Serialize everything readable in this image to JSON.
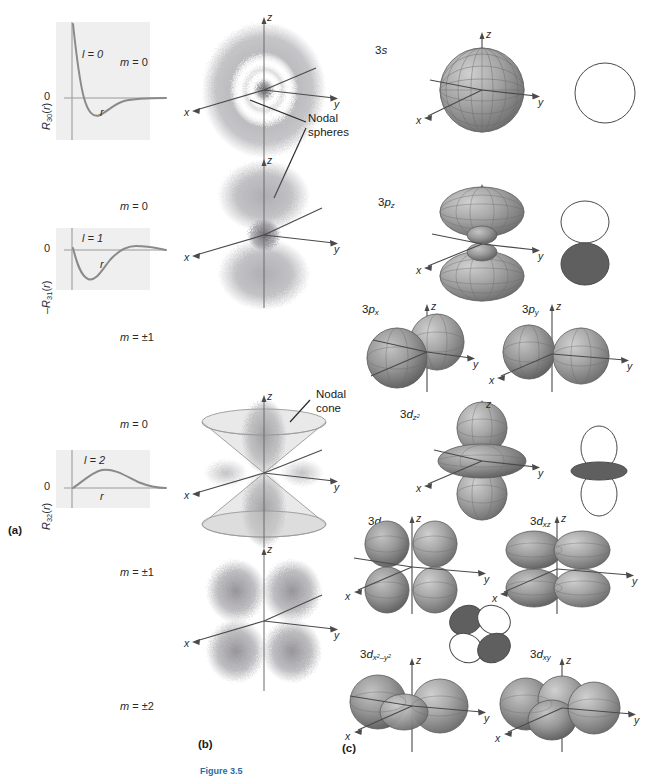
{
  "figure": {
    "caption": "Figure 3.5",
    "panels": [
      {
        "id": "a",
        "letter": "(a)",
        "description": "radial wave functions"
      },
      {
        "id": "b",
        "letter": "(b)",
        "description": "probability density clouds"
      },
      {
        "id": "c",
        "letter": "(c)",
        "description": "orbital surfaces"
      }
    ]
  },
  "radial_plots": [
    {
      "ylabel_prefix": "",
      "ylabel": "R",
      "n": "30",
      "l_label": "l = 0",
      "zero": "0",
      "xlabel": "r"
    },
    {
      "ylabel_prefix": "–",
      "ylabel": "R",
      "n": "31",
      "l_label": "l = 1",
      "zero": "0",
      "xlabel": "r"
    },
    {
      "ylabel_prefix": "",
      "ylabel": "R",
      "n": "32",
      "l_label": "l = 2",
      "zero": "0",
      "xlabel": "r"
    }
  ],
  "clouds": [
    {
      "m": "m = 0",
      "l": 0,
      "kind": "s"
    },
    {
      "m": "m = 0",
      "l": 1,
      "kind": "pz"
    },
    {
      "m": "m = ±1",
      "l": 1,
      "kind": "pxy"
    },
    {
      "m": "m = 0",
      "l": 2,
      "kind": "dz2"
    },
    {
      "m": "m = ±1",
      "l": 2,
      "kind": "dxz"
    },
    {
      "m": "m = ±2",
      "l": 2,
      "kind": "dxy"
    }
  ],
  "annotations": {
    "nodal_spheres": "Nodal\nspheres",
    "nodal_spheres_line1": "Nodal",
    "nodal_spheres_line2": "spheres",
    "nodal_cone_line1": "Nodal",
    "nodal_cone_line2": "cone"
  },
  "axes": {
    "x": "x",
    "y": "y",
    "z": "z"
  },
  "orbitals": [
    {
      "id": "3s",
      "label_main": "3",
      "label_em": "s",
      "sub": "",
      "sign_diagram": "sphere"
    },
    {
      "id": "3pz",
      "label_main": "3",
      "label_em": "p",
      "sub": "z",
      "sign_diagram": "two-lobe-vertical"
    },
    {
      "id": "3px",
      "label_main": "3",
      "label_em": "p",
      "sub": "x",
      "sign_diagram": "none"
    },
    {
      "id": "3py",
      "label_main": "3",
      "label_em": "p",
      "sub": "y",
      "sign_diagram": "none"
    },
    {
      "id": "3dz2",
      "label_main": "3",
      "label_em": "d",
      "sub": "z2",
      "sign_diagram": "dz2"
    },
    {
      "id": "3dyz",
      "label_main": "3",
      "label_em": "d",
      "sub": "yz",
      "sign_diagram": "none"
    },
    {
      "id": "3dxz",
      "label_main": "3",
      "label_em": "d",
      "sub": "xz",
      "sign_diagram": "cloverleaf"
    },
    {
      "id": "3dx2y2",
      "label_main": "3",
      "label_em": "d",
      "sub": "x2-y2",
      "sign_diagram": "none"
    },
    {
      "id": "3dxy",
      "label_main": "3",
      "label_em": "d",
      "sub": "xy",
      "sign_diagram": "none"
    }
  ],
  "colors": {
    "plot_bg": "#efefef",
    "curve": "#8a8a8a",
    "axis": "#9a9a9a",
    "cloud_dot": "#6f6d74",
    "surface_light": "#b9b9b9",
    "surface_mid": "#9a9a9a",
    "surface_dark": "#6e6e6e",
    "sign_fill": "#5f5f5f",
    "outline": "#3a3a3a",
    "text": "#231f20"
  }
}
